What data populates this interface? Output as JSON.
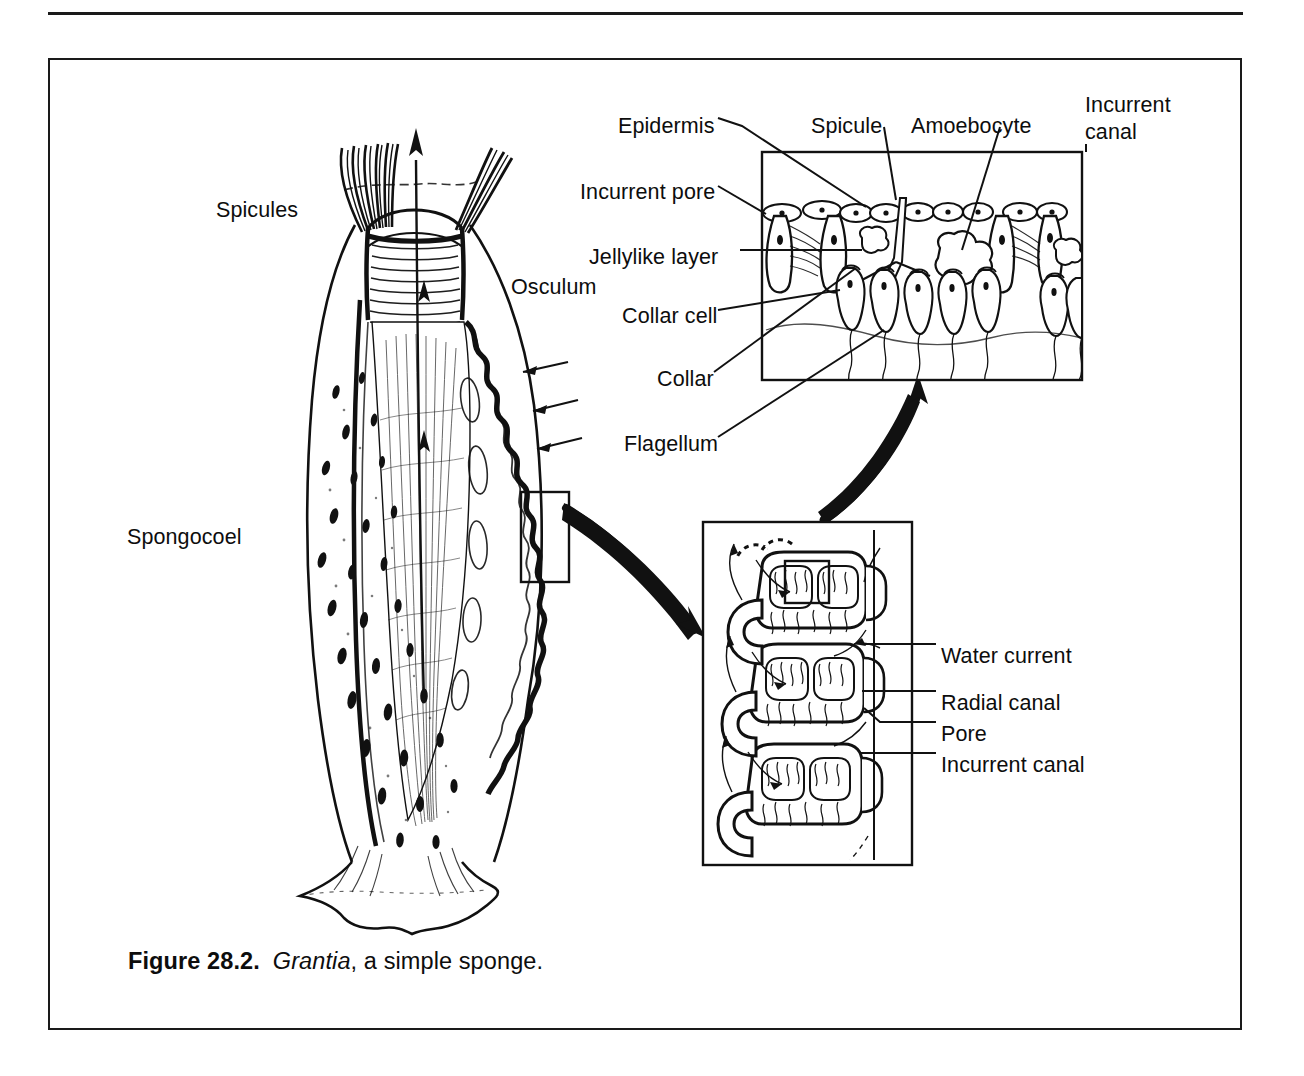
{
  "figure": {
    "caption_number": "Figure 28.2.",
    "caption_genus": "Grantia",
    "caption_rest": ", a simple sponge.",
    "colors": {
      "ink": "#1a1a1a",
      "background": "#ffffff"
    }
  },
  "main_diagram": {
    "name": "whole-sponge-cutaway",
    "labels": [
      {
        "id": "spicules",
        "text": "Spicules",
        "x": 216,
        "y": 197,
        "align": "left"
      },
      {
        "id": "osculum",
        "text": "Osculum",
        "x": 511,
        "y": 274,
        "align": "left"
      },
      {
        "id": "spongocoel",
        "text": "Spongocoel",
        "x": 127,
        "y": 524,
        "align": "left"
      }
    ]
  },
  "top_inset": {
    "name": "body-wall-detail",
    "labels": [
      {
        "id": "epidermis",
        "text": "Epidermis",
        "x": 618,
        "y": 113,
        "align": "left"
      },
      {
        "id": "spicule",
        "text": "Spicule",
        "x": 811,
        "y": 113,
        "align": "left"
      },
      {
        "id": "amoebocyte",
        "text": "Amoebocyte",
        "x": 911,
        "y": 113,
        "align": "left"
      },
      {
        "id": "incurrent-pore",
        "text": "Incurrent pore",
        "x": 580,
        "y": 179,
        "align": "left"
      },
      {
        "id": "jellylike-layer",
        "text": "Jellylike layer",
        "x": 589,
        "y": 244,
        "align": "left"
      },
      {
        "id": "collar-cell",
        "text": "Collar cell",
        "x": 622,
        "y": 303,
        "align": "left"
      },
      {
        "id": "collar",
        "text": "Collar",
        "x": 657,
        "y": 366,
        "align": "left"
      },
      {
        "id": "flagellum",
        "text": "Flagellum",
        "x": 624,
        "y": 431,
        "align": "left"
      }
    ],
    "corner_label": {
      "id": "incurrent-canal-top",
      "line1": "Incurrent",
      "line2": "canal",
      "x": 1085,
      "y": 92
    }
  },
  "bottom_inset": {
    "name": "canal-system-detail",
    "labels": [
      {
        "id": "water-current",
        "text": "Water current",
        "x": 941,
        "y": 643
      },
      {
        "id": "radial-canal",
        "text": "Radial canal",
        "x": 941,
        "y": 690
      },
      {
        "id": "pore",
        "text": "Pore",
        "x": 941,
        "y": 721
      },
      {
        "id": "incurrent-canal",
        "text": "Incurrent canal",
        "x": 941,
        "y": 752
      }
    ]
  }
}
